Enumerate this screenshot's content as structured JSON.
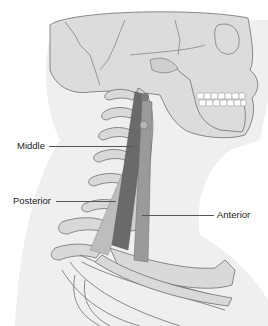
{
  "diagram": {
    "labels": {
      "middle": "Middle",
      "posterior": "Posterior",
      "anterior": "Anterior"
    },
    "colors": {
      "background": "#ffffff",
      "body_silhouette": "#ececec",
      "bone_fill": "#d9d9d9",
      "bone_outline": "#6e6e6e",
      "muscle_light": "#bdbdbd",
      "muscle_mid": "#8f8f8f",
      "muscle_dark": "#5e5e5e",
      "teeth": "#ffffff",
      "leader_line": "#555555",
      "label_text": "#222222"
    }
  }
}
